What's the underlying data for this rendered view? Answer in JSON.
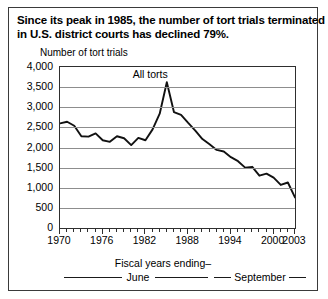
{
  "title": {
    "line1": "Since its peak in 1985, the number of tort trials terminated",
    "line2": "in U.S. district courts has declined 79%."
  },
  "axis_title": "Number of tort trials",
  "legend": {
    "heading": "Fiscal years ending–",
    "june": "June",
    "september": "September"
  },
  "colors": {
    "line": "#111111",
    "grid": "#8d8d8d",
    "frame": "#2e2e2e",
    "border": "#3a3a3a",
    "background": "#ffffff"
  },
  "chart_data": {
    "type": "line",
    "title": "Since its peak in 1985, the number of tort trials terminated in U.S. district courts has declined 79%.",
    "subtitle": "",
    "xlabel": "Fiscal years ending–",
    "ylabel": "Number of tort trials",
    "xlim": [
      1970,
      2003
    ],
    "ylim": [
      0,
      4000
    ],
    "yticks": [
      0,
      500,
      1000,
      1500,
      2000,
      2500,
      3000,
      3500,
      4000
    ],
    "ytick_labels": [
      "0",
      "500",
      "1,000",
      "1,500",
      "2,000",
      "2,500",
      "3,000",
      "3,500",
      "4,000"
    ],
    "xticks": [
      1970,
      1976,
      1982,
      1988,
      1994,
      2000,
      2003
    ],
    "xtick_labels": [
      "1970",
      "1976",
      "1982",
      "1988",
      "1994",
      "2000",
      "2003"
    ],
    "xtick_minor_interval": 1,
    "grid": "horizontal",
    "legend_position": "bottom",
    "annotations": [
      {
        "text": "All torts",
        "x": 1984,
        "y": 3800
      }
    ],
    "series": [
      {
        "name": "All torts",
        "x": [
          1970,
          1971,
          1972,
          1973,
          1974,
          1975,
          1976,
          1977,
          1978,
          1979,
          1980,
          1981,
          1982,
          1983,
          1984,
          1985,
          1986,
          1987,
          1988,
          1989,
          1990,
          1991,
          1992,
          1993,
          1994,
          1995,
          1996,
          1997,
          1998,
          1999,
          2000,
          2001,
          2002,
          2003
        ],
        "values": [
          2600,
          2640,
          2540,
          2280,
          2270,
          2350,
          2180,
          2140,
          2280,
          2230,
          2060,
          2240,
          2180,
          2450,
          2840,
          3620,
          2880,
          2810,
          2610,
          2420,
          2210,
          2080,
          1940,
          1900,
          1760,
          1660,
          1500,
          1520,
          1300,
          1350,
          1250,
          1070,
          1130,
          760
        ]
      }
    ]
  }
}
